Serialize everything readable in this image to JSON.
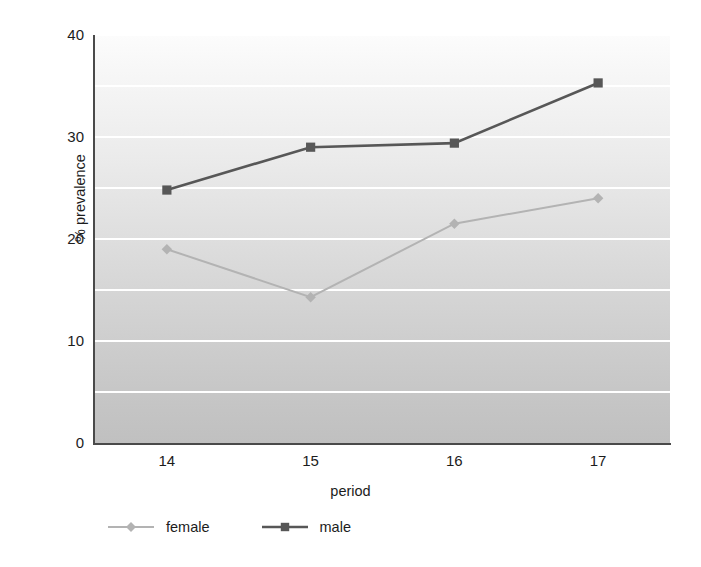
{
  "chart_data": {
    "type": "line",
    "title": "",
    "xlabel": "period",
    "ylabel": "% prevalence",
    "x": [
      14,
      15,
      16,
      17
    ],
    "xtick_labels": [
      "14",
      "15",
      "16",
      "17"
    ],
    "ytick_labels": [
      "0",
      "10",
      "20",
      "30",
      "40"
    ],
    "ytick_values": [
      0,
      10,
      20,
      30,
      40
    ],
    "ylim": [
      0,
      40
    ],
    "xlim": [
      13.5,
      17.5
    ],
    "grid": true,
    "gridline_values": [
      5,
      10,
      15,
      20,
      25,
      30,
      35,
      40
    ],
    "legend_position": "bottom-left",
    "series": [
      {
        "name": "female",
        "values": [
          19.0,
          14.3,
          21.5,
          24.0
        ],
        "color": "#b3b3b3",
        "marker": "diamond"
      },
      {
        "name": "male",
        "values": [
          24.8,
          29.0,
          29.4,
          35.3
        ],
        "color": "#575757",
        "marker": "square"
      }
    ]
  },
  "colors": {
    "female": "#b3b3b3",
    "male": "#575757",
    "gridline": "#ffffff",
    "axis": "#4a4a4a",
    "text": "#1c1c1c"
  }
}
